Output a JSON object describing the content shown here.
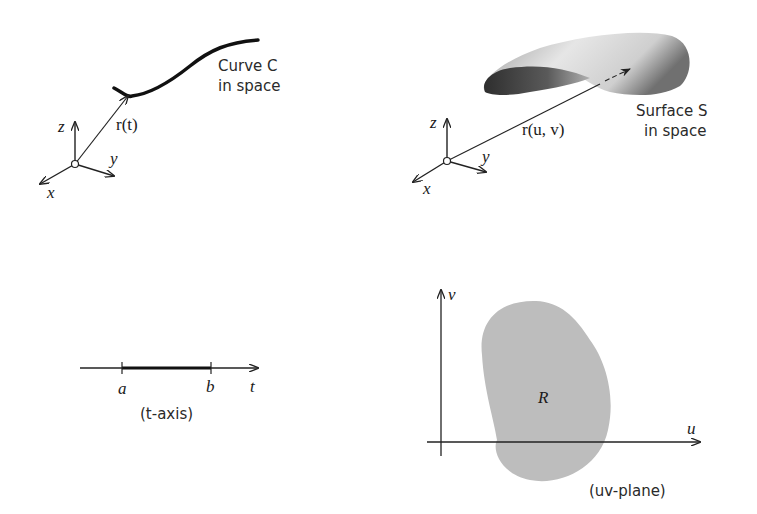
{
  "top_left": {
    "curve_label_line1": "Curve C",
    "curve_label_line2": "in space",
    "vector_label": "r(t)",
    "axes": {
      "z": "z",
      "y": "y",
      "x": "x"
    }
  },
  "top_right": {
    "surface_label_line1": "Surface S",
    "surface_label_line2": "in space",
    "vector_label": "r(u, v)",
    "axes": {
      "z": "z",
      "y": "y",
      "x": "x"
    }
  },
  "bottom_left": {
    "endpoint_a": "a",
    "endpoint_b": "b",
    "axis_name": "t",
    "caption": "(t-axis)"
  },
  "bottom_right": {
    "axis_v": "v",
    "axis_u": "u",
    "region_label": "R",
    "caption": "(uv-plane)",
    "region_color": "#bdbdbd"
  }
}
